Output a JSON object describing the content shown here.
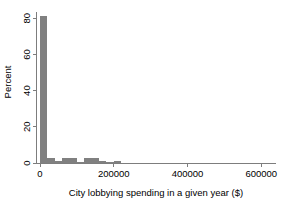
{
  "chart_data": {
    "type": "bar",
    "title": "",
    "subtitle": "",
    "xlabel": "City lobbying spending in a given year ($)",
    "ylabel": "Percent",
    "xlim": [
      0,
      640000
    ],
    "ylim": [
      0,
      84
    ],
    "grid": false,
    "legend": null,
    "bar_color": "#808080",
    "axis_color": "#7d7d7d",
    "bin_width": 20000,
    "x_ticks": [
      0,
      200000,
      400000,
      600000
    ],
    "x_tick_labels": [
      "0",
      "200000",
      "400000",
      "600000"
    ],
    "y_ticks": [
      0,
      20,
      40,
      60,
      80
    ],
    "y_tick_labels": [
      "0",
      "20",
      "40",
      "60",
      "80"
    ],
    "categories": [
      10000,
      30000,
      50000,
      70000,
      90000,
      110000,
      130000,
      150000,
      170000,
      190000,
      210000,
      230000,
      250000,
      270000,
      290000,
      310000,
      330000,
      350000,
      370000,
      390000,
      410000,
      430000,
      450000,
      470000,
      490000,
      510000,
      530000,
      550000,
      570000,
      590000
    ],
    "values": [
      81.5,
      2.8,
      1.2,
      3.0,
      2.9,
      0.6,
      2.8,
      2.9,
      1.1,
      0.5,
      0.9,
      0.2,
      0.2,
      0.1,
      0.1,
      0.0,
      0.0,
      0.1,
      0.0,
      0.0,
      0.0,
      0.0,
      0.0,
      0.0,
      0.0,
      0.0,
      0.0,
      0.0,
      0.0,
      0.0
    ]
  }
}
